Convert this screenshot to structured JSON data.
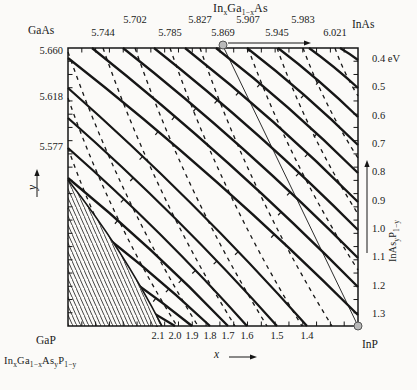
{
  "labels": {
    "corners": {
      "top_left": "GaAs",
      "top_right": "InAs",
      "bottom_left": "GaP",
      "bottom_right": "InP"
    },
    "axis_letters": {
      "x": "x",
      "y": "y"
    },
    "top_axis_upper_row": [
      {
        "text": "5.702",
        "px": 135
      },
      {
        "text": "5.827",
        "px": 200
      },
      {
        "text": "5.907",
        "px": 248
      },
      {
        "text": "5.983",
        "px": 303
      }
    ],
    "top_axis_lower_row": [
      {
        "text": "5.744",
        "px": 103
      },
      {
        "text": "5.785",
        "px": 170
      },
      {
        "text": "5.869",
        "px": 223
      },
      {
        "text": "5.945",
        "px": 277
      },
      {
        "text": "6.021",
        "px": 335
      }
    ],
    "left_axis": [
      {
        "text": "5.660",
        "px": 52
      },
      {
        "text": "5.618",
        "px": 98
      },
      {
        "text": "5.577",
        "px": 148
      }
    ],
    "right_axis": [
      {
        "text": "0.4 eV",
        "px": 60
      },
      {
        "text": "0.5",
        "px": 88
      },
      {
        "text": "0.6",
        "px": 117
      },
      {
        "text": "0.7",
        "px": 145
      },
      {
        "text": "0.8",
        "px": 173
      },
      {
        "text": "0.9",
        "px": 202
      },
      {
        "text": "1.0",
        "px": 230
      },
      {
        "text": "1.1",
        "px": 258
      },
      {
        "text": "1.2",
        "px": 287
      },
      {
        "text": "1.3",
        "px": 315
      }
    ],
    "bottom_axis": [
      {
        "text": "2.1",
        "px": 158
      },
      {
        "text": "2.0",
        "px": 175
      },
      {
        "text": "1.9",
        "px": 192
      },
      {
        "text": "1.8",
        "px": 210
      },
      {
        "text": "1.7",
        "px": 228
      },
      {
        "text": "1.6",
        "px": 247
      },
      {
        "text": "1.5",
        "px": 277
      },
      {
        "text": "1.4",
        "px": 307
      }
    ]
  },
  "formulas": {
    "top": [
      [
        "In",
        0
      ],
      [
        "x",
        1
      ],
      [
        "Ga",
        0
      ],
      [
        "1−x",
        1
      ],
      [
        "As",
        0
      ]
    ],
    "bottom_left": [
      [
        "In",
        0
      ],
      [
        "x",
        1
      ],
      [
        "Ga",
        0
      ],
      [
        "1−x",
        1
      ],
      [
        "As",
        0
      ],
      [
        "y",
        1
      ],
      [
        "P",
        0
      ],
      [
        "1−y",
        1
      ]
    ],
    "right": [
      [
        "InAs",
        0
      ],
      [
        "y",
        1
      ],
      [
        "P",
        0
      ],
      [
        "1−y",
        1
      ]
    ]
  },
  "colors": {
    "ink": "#161616",
    "dot_fill": "#b9b9b9",
    "dot_stroke": "#555555",
    "paper": "#fbfaf8"
  },
  "chart_data": {
    "type": "contour",
    "plot_box": [
      68,
      48,
      358,
      326
    ],
    "x_axis": {
      "label": "x",
      "direction": "increases right"
    },
    "y_axis": {
      "label": "y",
      "direction": "increases up"
    },
    "solid_contours_bandgap_eV": [
      {
        "value": 0.4,
        "x1": 340,
        "y1": 48,
        "x2": 358,
        "y2": 60
      },
      {
        "value": 0.5,
        "x1": 309,
        "y1": 48,
        "x2": 358,
        "y2": 88
      },
      {
        "value": 0.6,
        "x1": 278,
        "y1": 48,
        "x2": 358,
        "y2": 117
      },
      {
        "value": 0.7,
        "x1": 247,
        "y1": 48,
        "x2": 358,
        "y2": 145
      },
      {
        "value": 0.8,
        "x1": 216,
        "y1": 48,
        "x2": 358,
        "y2": 173
      },
      {
        "value": 0.9,
        "x1": 185,
        "y1": 48,
        "x2": 358,
        "y2": 202
      },
      {
        "value": 1.0,
        "x1": 154,
        "y1": 48,
        "x2": 358,
        "y2": 230
      },
      {
        "value": 1.1,
        "x1": 123,
        "y1": 48,
        "x2": 358,
        "y2": 258
      },
      {
        "value": 1.2,
        "x1": 92,
        "y1": 48,
        "x2": 358,
        "y2": 287
      },
      {
        "value": 1.3,
        "x1": 68,
        "y1": 58,
        "x2": 358,
        "y2": 315
      },
      {
        "value": 1.4,
        "x1": 68,
        "y1": 88,
        "x2": 307,
        "y2": 326
      },
      {
        "value": 1.5,
        "x1": 68,
        "y1": 118,
        "x2": 277,
        "y2": 326
      },
      {
        "value": 1.6,
        "x1": 68,
        "y1": 148,
        "x2": 247,
        "y2": 326
      },
      {
        "value": 1.7,
        "x1": 68,
        "y1": 178,
        "x2": 228,
        "y2": 326
      },
      {
        "value": 1.8,
        "x1": 68,
        "y1": 208,
        "x2": 210,
        "y2": 326
      },
      {
        "value": 1.9,
        "x1": 68,
        "y1": 238,
        "x2": 192,
        "y2": 326
      },
      {
        "value": 2.0,
        "x1": 68,
        "y1": 268,
        "x2": 175,
        "y2": 326
      },
      {
        "value": 2.1,
        "x1": 68,
        "y1": 298,
        "x2": 158,
        "y2": 326
      }
    ],
    "dashed_contours_lattice_A": [
      {
        "value": 5.577,
        "x1": 68,
        "y1": 148,
        "x2": 153,
        "y2": 326
      },
      {
        "value": 5.618,
        "x1": 68,
        "y1": 98,
        "x2": 177,
        "y2": 326
      },
      {
        "value": 5.66,
        "x1": 68,
        "y1": 52,
        "x2": 198,
        "y2": 326
      },
      {
        "value": 5.702,
        "x1": 135,
        "y1": 48,
        "x2": 267,
        "y2": 326
      },
      {
        "value": 5.744,
        "x1": 103,
        "y1": 48,
        "x2": 235,
        "y2": 326
      },
      {
        "value": 5.785,
        "x1": 170,
        "y1": 48,
        "x2": 302,
        "y2": 326
      },
      {
        "value": 5.827,
        "x1": 200,
        "y1": 48,
        "x2": 332,
        "y2": 326
      },
      {
        "value": 5.907,
        "x1": 248,
        "y1": 48,
        "x2": 358,
        "y2": 270
      },
      {
        "value": 5.945,
        "x1": 277,
        "y1": 48,
        "x2": 358,
        "y2": 214
      },
      {
        "value": 5.983,
        "x1": 303,
        "y1": 48,
        "x2": 358,
        "y2": 158
      },
      {
        "value": 6.021,
        "x1": 335,
        "y1": 48,
        "x2": 358,
        "y2": 96
      }
    ],
    "inp_matched_line": {
      "value": 5.869,
      "x1": 223,
      "y1": 46,
      "x2": 358,
      "y2": 326
    },
    "marker_dots": [
      [
        223,
        45
      ],
      [
        358,
        326
      ]
    ],
    "hatch_region": {
      "start": [
        68,
        180
      ],
      "ctrl": [
        122,
        248
      ],
      "end": [
        162,
        326
      ]
    },
    "arrows": {
      "top_axis": {
        "x1": 228,
        "y1": 43,
        "x2": 311,
        "y2": 43
      },
      "right_axis": {
        "x1": 367,
        "y1": 253,
        "x2": 367,
        "y2": 160
      },
      "x_axis": {
        "x1": 229,
        "y1": 357,
        "x2": 257,
        "y2": 357
      },
      "y_axis": {
        "x1": 37,
        "y1": 197,
        "x2": 37,
        "y2": 169
      }
    }
  }
}
